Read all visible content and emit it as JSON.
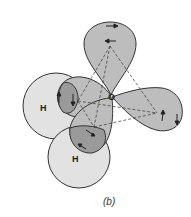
{
  "figure": {
    "caption": "(b)",
    "atoms": {
      "oxygen": "O",
      "hydrogen_left": "H",
      "hydrogen_bottom": "H"
    },
    "colors": {
      "lobe_fill": "#bdbdbd",
      "h_fill": "#e2e2e2",
      "overlap_fill": "#9a9a9a",
      "outline": "#333333"
    }
  }
}
